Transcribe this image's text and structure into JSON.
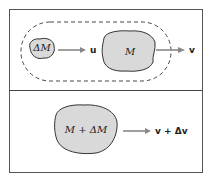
{
  "top_panel": {
    "small_mass_label": "ΔM",
    "small_velocity_label": "u",
    "large_mass_label": "M",
    "large_velocity_label": "v"
  },
  "bottom_panel": {
    "combined_mass_label": "M + ΔM",
    "combined_velocity_label": "v + Δv"
  },
  "colors": {
    "blob_fill": "#d9d9d9",
    "stroke": "#333333",
    "arrow": "#888888"
  }
}
